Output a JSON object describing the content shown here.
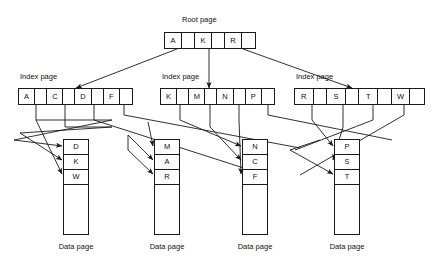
{
  "diagram": {
    "line_color": "#1a1a1a",
    "background": "#ffffff"
  },
  "root": {
    "label": "Root page",
    "cells": [
      {
        "type": "key",
        "text": "A"
      },
      {
        "type": "pointer",
        "text": ""
      },
      {
        "type": "key",
        "text": "K"
      },
      {
        "type": "pointer",
        "text": ""
      },
      {
        "type": "key",
        "text": "R"
      },
      {
        "type": "pointer",
        "text": ""
      }
    ]
  },
  "index_pages": [
    {
      "label": "Index page",
      "cells": [
        {
          "type": "key",
          "text": "A"
        },
        {
          "type": "pointer",
          "text": ""
        },
        {
          "type": "key",
          "text": "C"
        },
        {
          "type": "pointer",
          "text": ""
        },
        {
          "type": "key",
          "text": "D"
        },
        {
          "type": "pointer",
          "text": ""
        },
        {
          "type": "key",
          "text": "F"
        },
        {
          "type": "pointer",
          "text": ""
        }
      ]
    },
    {
      "label": "Index page",
      "cells": [
        {
          "type": "key",
          "text": "K"
        },
        {
          "type": "pointer",
          "text": ""
        },
        {
          "type": "key",
          "text": "M"
        },
        {
          "type": "pointer",
          "text": ""
        },
        {
          "type": "key",
          "text": "N"
        },
        {
          "type": "pointer",
          "text": ""
        },
        {
          "type": "key",
          "text": "P"
        },
        {
          "type": "pointer",
          "text": ""
        }
      ]
    },
    {
      "label": "Index page",
      "cells": [
        {
          "type": "key",
          "text": "R"
        },
        {
          "type": "pointer",
          "text": ""
        },
        {
          "type": "key",
          "text": "S"
        },
        {
          "type": "pointer",
          "text": ""
        },
        {
          "type": "key",
          "text": "T"
        },
        {
          "type": "pointer",
          "text": ""
        },
        {
          "type": "key",
          "text": "W"
        },
        {
          "type": "pointer",
          "text": ""
        }
      ]
    }
  ],
  "data_pages": [
    {
      "label": "Data page",
      "rows": [
        "D",
        "K",
        "W"
      ],
      "free_rows": 4
    },
    {
      "label": "Data page",
      "rows": [
        "M",
        "A",
        "R"
      ],
      "free_rows": 4
    },
    {
      "label": "Data page",
      "rows": [
        "N",
        "C",
        "F"
      ],
      "free_rows": 4
    },
    {
      "label": "Data page",
      "rows": [
        "P",
        "S",
        "T"
      ],
      "free_rows": 4
    }
  ]
}
